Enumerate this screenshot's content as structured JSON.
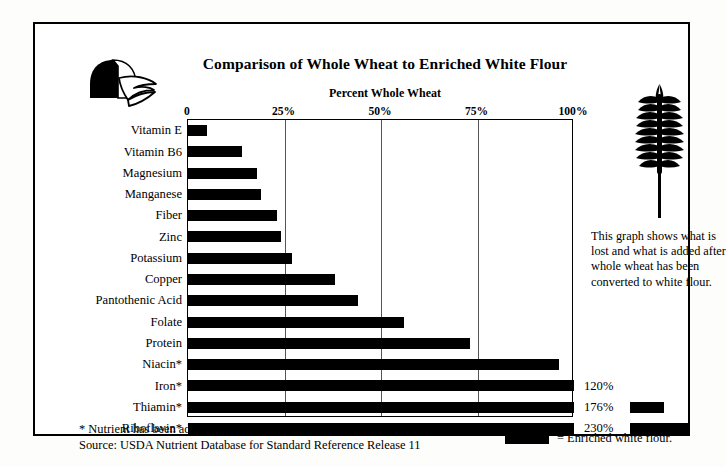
{
  "header": {
    "title": "Comparison of Whole Wheat to Enriched White Flour",
    "axis_title": "Percent Whole Wheat",
    "bread_icon": "bread-loaf-icon",
    "wheat_icon": "wheat-stalk-icon"
  },
  "side_note": "This graph shows what is lost and what is added after whole wheat has been converted to white flour.",
  "footnote": {
    "asterisk_note": "* Nutrient has been added to enrich white flour.",
    "source": "Source: USDA Nutrient Database for Standard Reference Release 11"
  },
  "legend": {
    "equals": "= Enriched white flour.",
    "swatch_color": "#000000"
  },
  "chart_data": {
    "type": "bar",
    "orientation": "horizontal",
    "title": "Comparison of Whole Wheat to Enriched White Flour",
    "subtitle": "Percent Whole Wheat",
    "xlabel": "Percent Whole Wheat",
    "ylabel": "",
    "xlim": [
      0,
      100
    ],
    "grid": true,
    "bar_color": "#000000",
    "legend_position": "bottom-right",
    "tick_labels": [
      "0",
      "25%",
      "50%",
      "75%",
      "100%"
    ],
    "tick_values": [
      0,
      25,
      50,
      75,
      100
    ],
    "categories": [
      "Vitamin E",
      "Vitamin B6",
      "Magnesium",
      "Manganese",
      "Fiber",
      "Zinc",
      "Potassium",
      "Copper",
      "Pantothenic Acid",
      "Folate",
      "Protein",
      "Niacin*",
      "Iron*",
      "Thiamin*",
      "Riboflavin*"
    ],
    "values": [
      5,
      14,
      18,
      19,
      23,
      24,
      27,
      38,
      44,
      56,
      73,
      96,
      120,
      176,
      230
    ],
    "data_labels": [
      "",
      "",
      "",
      "",
      "",
      "",
      "",
      "",
      "",
      "",
      "",
      "",
      "120%",
      "176%",
      "230%"
    ]
  }
}
